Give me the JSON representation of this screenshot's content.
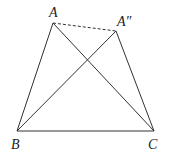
{
  "diagram": {
    "points": {
      "A": {
        "x": 53,
        "y": 23
      },
      "A2": {
        "x": 116,
        "y": 31
      },
      "B": {
        "x": 17,
        "y": 131
      },
      "C": {
        "x": 154,
        "y": 131
      }
    },
    "labels": {
      "A": "A",
      "A2": "A″",
      "B": "B",
      "C": "C"
    },
    "segments": [
      {
        "from": "A",
        "to": "B",
        "style": "solid"
      },
      {
        "from": "A",
        "to": "C",
        "style": "solid"
      },
      {
        "from": "A2",
        "to": "B",
        "style": "solid"
      },
      {
        "from": "A2",
        "to": "C",
        "style": "solid"
      },
      {
        "from": "B",
        "to": "C",
        "style": "solid"
      },
      {
        "from": "A",
        "to": "A2",
        "style": "dashed"
      }
    ],
    "stroke_color": "#333333"
  }
}
